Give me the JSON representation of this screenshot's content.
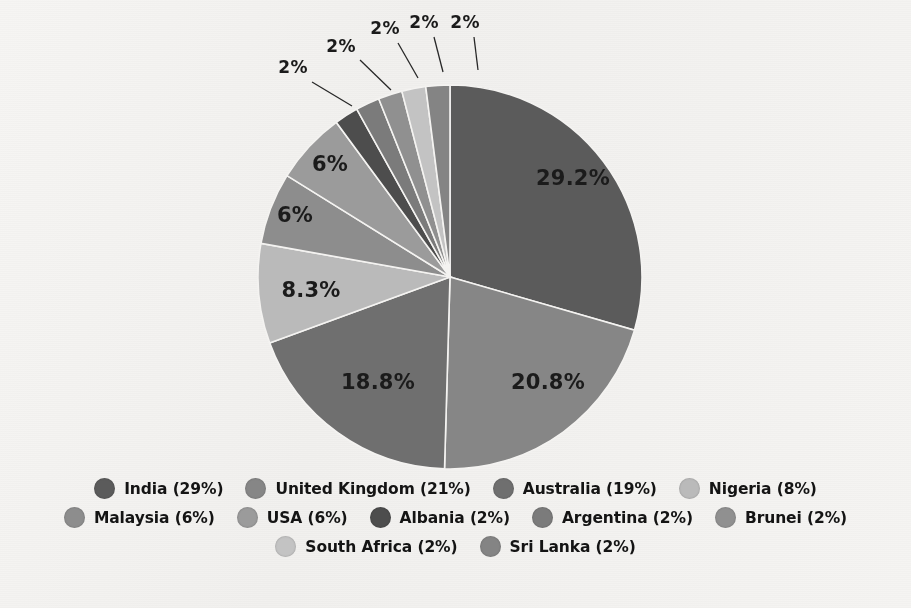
{
  "chart_data": {
    "type": "pie",
    "title": "",
    "subtitle": "",
    "xlabel": "",
    "ylabel": "",
    "grid": false,
    "legend_position": "bottom",
    "start_angle_deg": -90,
    "direction": "clockwise",
    "categories": [
      "India",
      "United Kingdom",
      "Australia",
      "Nigeria",
      "Malaysia",
      "USA",
      "Albania",
      "Argentina",
      "Brunei",
      "South Africa",
      "Sri Lanka"
    ],
    "values": [
      29.2,
      20.8,
      18.8,
      8.3,
      6.0,
      6.0,
      2.0,
      2.0,
      2.0,
      2.0,
      2.0
    ],
    "slice_labels": [
      "29.2%",
      "20.8%",
      "18.8%",
      "8.3%",
      "6%",
      "6%",
      "2%",
      "2%",
      "2%",
      "2%",
      "2%"
    ],
    "legend_labels": [
      "India (29%)",
      "United Kingdom (21%)",
      "Australia (19%)",
      "Nigeria (8%)",
      "Malaysia (6%)",
      "USA (6%)",
      "Albania (2%)",
      "Argentina (2%)",
      "Brunei (2%)",
      "South Africa (2%)",
      "Sri Lanka (2%)"
    ],
    "colors": [
      "#5c5c5c",
      "#868686",
      "#6f6f6f",
      "#b9b9b9",
      "#8d8d8d",
      "#9a9a9a",
      "#4e4e4e",
      "#7b7b7b",
      "#909090",
      "#c2c2c2",
      "#848484"
    ]
  },
  "slices": [
    {
      "name": "India",
      "label": "29.2%",
      "value": 29.2,
      "color": "#5c5c5c",
      "label_x": 573,
      "label_y": 185,
      "callout": false
    },
    {
      "name": "United Kingdom",
      "label": "20.8%",
      "value": 20.8,
      "color": "#868686",
      "label_x": 548,
      "label_y": 389,
      "callout": false
    },
    {
      "name": "Australia",
      "label": "18.8%",
      "value": 18.8,
      "color": "#6f6f6f",
      "label_x": 378,
      "label_y": 389,
      "callout": false
    },
    {
      "name": "Nigeria",
      "label": "8.3%",
      "value": 8.3,
      "color": "#b9b9b9",
      "label_x": 311,
      "label_y": 297,
      "callout": false
    },
    {
      "name": "Malaysia",
      "label": "6%",
      "value": 6.0,
      "color": "#8d8d8d",
      "label_x": 295,
      "label_y": 222,
      "callout": false
    },
    {
      "name": "USA",
      "label": "6%",
      "value": 6.0,
      "color": "#9a9a9a",
      "label_x": 330,
      "label_y": 171,
      "callout": false
    },
    {
      "name": "Albania",
      "label": "2%",
      "value": 2.0,
      "color": "#4e4e4e",
      "label_x": 293,
      "label_y": 73,
      "callout": true,
      "line_x1": 312,
      "line_y1": 82,
      "line_x2": 352,
      "line_y2": 106
    },
    {
      "name": "Argentina",
      "label": "2%",
      "value": 2.0,
      "color": "#7b7b7b",
      "label_x": 341,
      "label_y": 52,
      "callout": true,
      "line_x1": 360,
      "line_y1": 60,
      "line_x2": 391,
      "line_y2": 90
    },
    {
      "name": "Brunei",
      "label": "2%",
      "value": 2.0,
      "color": "#909090",
      "label_x": 385,
      "label_y": 34,
      "callout": true,
      "line_x1": 398,
      "line_y1": 43,
      "line_x2": 418,
      "line_y2": 78
    },
    {
      "name": "South Africa",
      "label": "2%",
      "value": 2.0,
      "color": "#c2c2c2",
      "label_x": 424,
      "label_y": 28,
      "callout": true,
      "line_x1": 434,
      "line_y1": 37,
      "line_x2": 443,
      "line_y2": 72
    },
    {
      "name": "Sri Lanka",
      "label": "2%",
      "value": 2.0,
      "color": "#848484",
      "label_x": 465,
      "label_y": 28,
      "callout": true,
      "line_x1": 474,
      "line_y1": 37,
      "line_x2": 478,
      "line_y2": 70
    }
  ],
  "legend": {
    "rows": [
      [
        {
          "label": "India (29%)",
          "color": "#5c5c5c"
        },
        {
          "label": "United Kingdom (21%)",
          "color": "#868686"
        },
        {
          "label": "Australia (19%)",
          "color": "#6f6f6f"
        },
        {
          "label": "Nigeria (8%)",
          "color": "#b9b9b9"
        }
      ],
      [
        {
          "label": "Malaysia (6%)",
          "color": "#8d8d8d"
        },
        {
          "label": "USA (6%)",
          "color": "#9a9a9a"
        },
        {
          "label": "Albania (2%)",
          "color": "#4e4e4e"
        },
        {
          "label": "Argentina (2%)",
          "color": "#7b7b7b"
        },
        {
          "label": "Brunei (2%)",
          "color": "#909090"
        }
      ],
      [
        {
          "label": "South Africa (2%)",
          "color": "#c2c2c2"
        },
        {
          "label": "Sri Lanka (2%)",
          "color": "#848484"
        }
      ]
    ]
  },
  "geometry": {
    "cx": 450,
    "cy": 277,
    "r": 192
  }
}
